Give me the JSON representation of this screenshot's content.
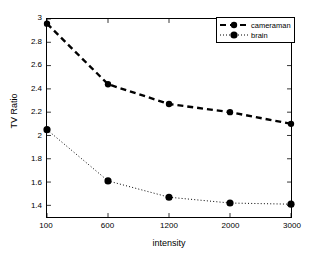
{
  "chart_data": {
    "type": "line",
    "title": "",
    "xlabel": "intensity",
    "ylabel": "TV Ratio",
    "categories": [
      "100",
      "600",
      "1200",
      "2000",
      "3000"
    ],
    "x": [
      100,
      600,
      1200,
      2000,
      3000
    ],
    "xtick_labels": [
      "100",
      "600",
      "1200",
      "2000",
      "3000"
    ],
    "ytick_labels": [
      "1.4",
      "1.6",
      "1.8",
      "2",
      "2.2",
      "2.4",
      "2.6",
      "2.8",
      "3"
    ],
    "ytick_values": [
      1.4,
      1.6,
      1.8,
      2.0,
      2.2,
      2.4,
      2.6,
      2.8,
      3.0
    ],
    "ylim": [
      1.3,
      3.0
    ],
    "xlim_categorical": true,
    "grid": false,
    "legend_position": "top-right",
    "series": [
      {
        "name": "cameraman",
        "values": [
          2.96,
          2.44,
          2.27,
          2.2,
          2.1
        ],
        "line_style": "dashed",
        "marker": "filled-circle",
        "color": "#000000"
      },
      {
        "name": "brain",
        "values": [
          2.05,
          1.61,
          1.47,
          1.42,
          1.41
        ],
        "line_style": "dotted",
        "marker": "filled-circle",
        "color": "#000000"
      }
    ]
  },
  "legend": {
    "entries": [
      {
        "label": "cameraman"
      },
      {
        "label": "brain"
      }
    ]
  },
  "axes": {
    "x_title": "intensity",
    "y_title": "TV Ratio"
  }
}
